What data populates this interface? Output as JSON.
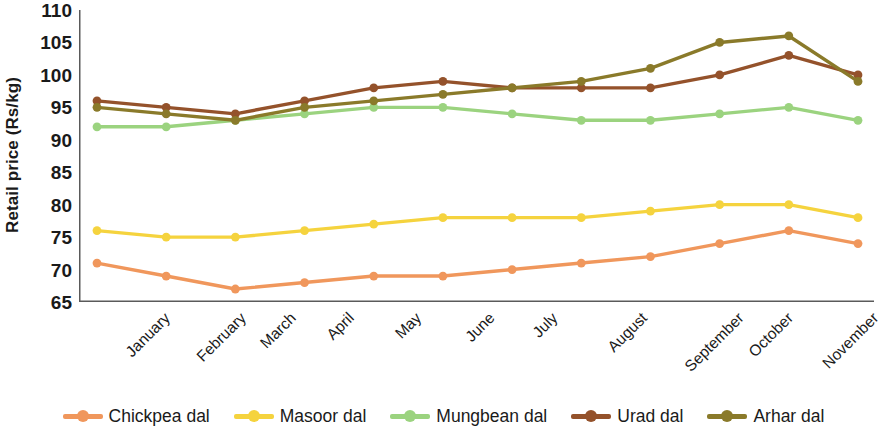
{
  "chart_data": {
    "type": "line",
    "title": "",
    "xlabel": "",
    "ylabel": "Retail price (Rs/kg)",
    "ylim": [
      65,
      110
    ],
    "yticks": [
      65,
      70,
      75,
      80,
      85,
      90,
      95,
      100,
      105,
      110
    ],
    "grid": false,
    "legend_position": "bottom",
    "categories": [
      "January",
      "February",
      "March",
      "April",
      "May",
      "June",
      "July",
      "August",
      "September",
      "October",
      "November",
      "December"
    ],
    "series": [
      {
        "name": "Chickpea dal",
        "color": "#F0975C",
        "values": [
          71,
          69,
          67,
          68,
          69,
          69,
          70,
          71,
          72,
          74,
          76,
          74
        ]
      },
      {
        "name": "Masoor dal",
        "color": "#F5D33E",
        "values": [
          76,
          75,
          75,
          76,
          77,
          78,
          78,
          78,
          79,
          80,
          80,
          78
        ]
      },
      {
        "name": "Mungbean dal",
        "color": "#9BD37F",
        "values": [
          92,
          92,
          93,
          94,
          95,
          95,
          94,
          93,
          93,
          94,
          95,
          93
        ]
      },
      {
        "name": "Urad dal",
        "color": "#94522B",
        "values": [
          96,
          95,
          94,
          96,
          98,
          99,
          98,
          98,
          98,
          100,
          103,
          100
        ]
      },
      {
        "name": "Arhar dal",
        "color": "#8A7A2A",
        "values": [
          95,
          94,
          93,
          95,
          96,
          97,
          98,
          99,
          101,
          105,
          106,
          99
        ]
      }
    ]
  },
  "legend": {
    "items": [
      {
        "label": "Chickpea dal"
      },
      {
        "label": "Masoor dal"
      },
      {
        "label": "Mungbean dal"
      },
      {
        "label": "Urad dal"
      },
      {
        "label": "Arhar dal"
      }
    ]
  },
  "axis": {
    "y_label": "Retail price (Rs/kg)",
    "y_tick_labels": [
      "110",
      "105",
      "100",
      "95",
      "90",
      "85",
      "80",
      "75",
      "70",
      "65"
    ],
    "x_tick_labels": [
      "January",
      "February",
      "March",
      "April",
      "May",
      "June",
      "July",
      "August",
      "September",
      "October",
      "November",
      "December"
    ]
  }
}
